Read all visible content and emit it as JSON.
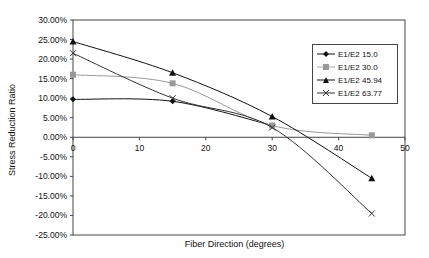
{
  "chart_data": {
    "type": "line",
    "title": "",
    "xlabel": "Fiber Direction (degrees)",
    "ylabel": "Stress Reduction Ratio",
    "xlim": [
      0,
      50
    ],
    "ylim": [
      -0.25,
      0.3
    ],
    "x_ticks": [
      "0",
      "10",
      "20",
      "30",
      "40",
      "50"
    ],
    "y_ticks": [
      "30.00%",
      "25.00%",
      "20.00%",
      "15.00%",
      "10.00%",
      "5.00%",
      "0.00%",
      "-5.00%",
      "-10.00%",
      "-15.00%",
      "-20.00%",
      "-25.00%"
    ],
    "grid": false,
    "legend_position": "upper right (inside)",
    "x": [
      0,
      15,
      30,
      45
    ],
    "series": [
      {
        "name": "E1/E2 15.0",
        "marker": "diamond",
        "color": "#111111",
        "values": [
          0.097,
          0.092,
          0.03,
          null
        ]
      },
      {
        "name": "E1/E2 30.0",
        "marker": "square",
        "color": "#999999",
        "values": [
          0.16,
          0.138,
          0.03,
          0.005
        ]
      },
      {
        "name": "E1/E2 45.94",
        "marker": "triangle",
        "color": "#111111",
        "values": [
          0.245,
          0.165,
          0.053,
          -0.105
        ]
      },
      {
        "name": "E1/E2 63.77",
        "marker": "x",
        "color": "#333333",
        "values": [
          0.215,
          0.1,
          0.025,
          -0.195
        ]
      }
    ]
  },
  "labels": {
    "xlabel": "Fiber Direction (degrees)",
    "ylabel": "Stress Reduction Ratio",
    "legend": [
      "E1/E2 15.0",
      "E1/E2 30.0",
      "E1/E2 45.94",
      "E1/E2 63.77"
    ]
  }
}
